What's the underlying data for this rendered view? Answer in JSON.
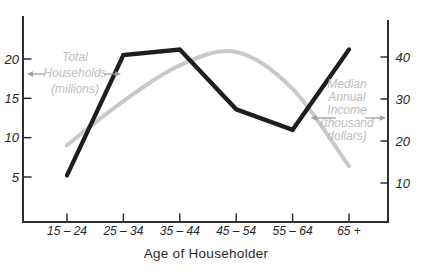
{
  "chart_data": {
    "type": "line",
    "title": "",
    "xlabel": "Age of Householder",
    "categories": [
      "15 – 24",
      "25 – 34",
      "35 – 44",
      "45 – 54",
      "55 – 64",
      "65 +"
    ],
    "series": [
      {
        "name": "Total Households (millions)",
        "axis": "left",
        "color": "#1e1e1e",
        "shape": "angular",
        "values": [
          5.2,
          20.5,
          21.2,
          13.6,
          11.0,
          21.2
        ],
        "label_lines": [
          "Total",
          "Households",
          "(millions)"
        ]
      },
      {
        "name": "Median Annual Income (thousand dollars)",
        "axis": "right",
        "color": "#c9c9c9",
        "shape": "smooth",
        "values": [
          19.0,
          29.5,
          38.0,
          41.2,
          32.4,
          14.0
        ],
        "label_lines": [
          "Median",
          "Annual",
          "Income",
          "(thousand",
          "dollars)"
        ]
      }
    ],
    "left_axis": {
      "ticks": [
        5,
        10,
        15,
        20
      ]
    },
    "right_axis": {
      "ticks": [
        10,
        20,
        30,
        40
      ]
    },
    "grid": false,
    "legend": "in-plot annotations with arrows"
  },
  "colors": {
    "background": "#ffffff",
    "axis": "#2e2e2e",
    "tick_label": "#272727",
    "annotation_text": "#bdbdbd",
    "arrow": "#9e9e9e",
    "households_line": "#1e1e1e",
    "income_line": "#c9c9c9"
  }
}
